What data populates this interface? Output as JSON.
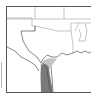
{
  "header": {
    "title_clipped": ""
  },
  "map": {
    "region": "South-central United States and northeastern Mexico",
    "layers": [
      {
        "name": "state-borders",
        "color": "#777777"
      },
      {
        "name": "coastline",
        "color": "#555555"
      },
      {
        "name": "range-core",
        "label": "Species range",
        "color": "#7a7a7a"
      },
      {
        "name": "range-edge",
        "label": "Peripheral range",
        "color": "#c4c4c4"
      }
    ]
  }
}
